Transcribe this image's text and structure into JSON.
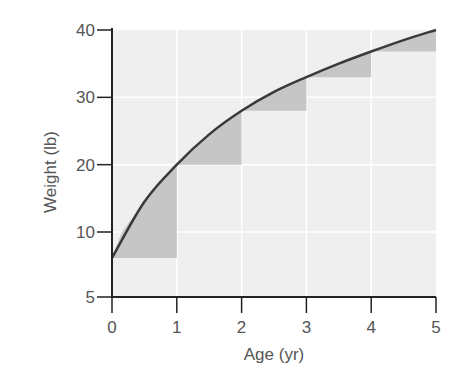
{
  "chart_data": {
    "type": "line",
    "title": "",
    "xlabel": "Age (yr)",
    "ylabel": "Weight (lb)",
    "xlim": [
      0,
      5
    ],
    "ylim": [
      5,
      40
    ],
    "x_ticks": [
      "0",
      "1",
      "2",
      "3",
      "4",
      "5"
    ],
    "y_ticks": [
      "5",
      "10",
      "20",
      "30",
      "40"
    ],
    "grid": true,
    "legend": null,
    "series": [
      {
        "name": "Weight curve",
        "x": [
          0,
          0.5,
          1,
          1.5,
          2,
          2.5,
          3,
          3.5,
          4,
          4.5,
          5
        ],
        "values": [
          8,
          14.5,
          20,
          24.5,
          28,
          30.8,
          33,
          35,
          36.8,
          38.5,
          40
        ]
      }
    ],
    "shaded_triangles": [
      {
        "x_start": 0,
        "x_end": 1,
        "y_low": 8,
        "y_high": 20
      },
      {
        "x_start": 1,
        "x_end": 2,
        "y_low": 20,
        "y_high": 28
      },
      {
        "x_start": 2,
        "x_end": 3,
        "y_low": 28,
        "y_high": 33
      },
      {
        "x_start": 3,
        "x_end": 4,
        "y_low": 33,
        "y_high": 36.8
      },
      {
        "x_start": 4,
        "x_end": 5,
        "y_low": 36.8,
        "y_high": 40
      }
    ]
  },
  "colors": {
    "plot_background": "#efefef",
    "grid": "#ffffff",
    "shade": "#c6c6c6",
    "curve": "#3a3a3a",
    "axis": "#222222",
    "text": "#555555"
  }
}
